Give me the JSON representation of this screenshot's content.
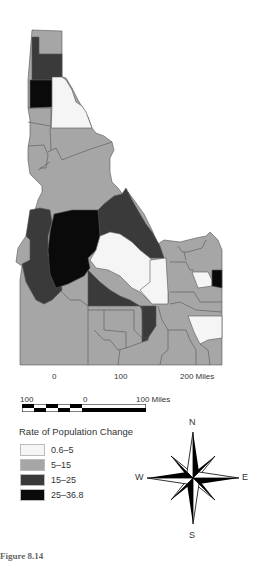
{
  "map": {
    "title": "Rate of Population Change",
    "region": "Idaho counties",
    "colors": {
      "class_1": "#f5f5f5",
      "class_2": "#a6a6a6",
      "class_3": "#3a3a3a",
      "class_4": "#0a0a0a",
      "border": "#555555"
    }
  },
  "axis_labels": {
    "tick_0": "0",
    "tick_100": "100",
    "tick_200": "200 Miles"
  },
  "scale_bar": {
    "left": "100",
    "center": "0",
    "right": "100 Miles"
  },
  "legend": {
    "title": "Rate of Population Change",
    "items": [
      {
        "label": "0.6–5",
        "color": "#f5f5f5"
      },
      {
        "label": "5–15",
        "color": "#a6a6a6"
      },
      {
        "label": "15–25",
        "color": "#3a3a3a"
      },
      {
        "label": "25–36.8",
        "color": "#0a0a0a"
      }
    ]
  },
  "compass": {
    "n": "N",
    "s": "S",
    "e": "E",
    "w": "W"
  },
  "caption": "Figure 8.14"
}
